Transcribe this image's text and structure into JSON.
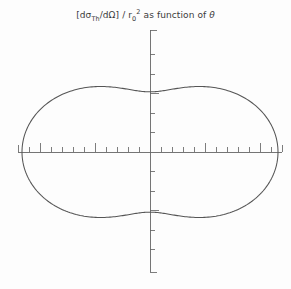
{
  "figure": {
    "width": 291,
    "height": 289,
    "background_color": "#fdfdfd",
    "line_color": "#555555",
    "axis_color": "#666666",
    "text_color": "#3a3a3a"
  },
  "title": {
    "full_text": "[dσTh/dΩ] / r₀0² as function of θ",
    "prefix": "[dσ",
    "subscript_1": "Th",
    "middle": "/dΩ] / r",
    "subscript_2": "0",
    "superscript": "2",
    "suffix": " as function of ",
    "theta_symbol": "θ"
  },
  "chart_data": {
    "type": "line",
    "plot_style": "polar",
    "xlabel": "",
    "ylabel": "",
    "formula": "0.5 * (1 + cos^2(theta))",
    "theta_unit": "degrees",
    "r_max": 1.0,
    "r_min": 0.5,
    "xlim": [
      -1.15,
      1.15
    ],
    "ylim": [
      -1.15,
      1.15
    ],
    "grid": false,
    "legend": "none",
    "axes": {
      "horizontal": {
        "visible": true,
        "minor_tick_count_per_side": 11,
        "major_tick_count_per_side": 2,
        "tick_direction": "up",
        "endcap": "tick"
      },
      "vertical": {
        "visible": true,
        "minor_tick_count_per_side": 5,
        "major_tick_count_per_side": 1,
        "tick_direction": "right",
        "endcap": "tick"
      }
    },
    "theta": [
      0,
      10,
      20,
      30,
      40,
      50,
      60,
      70,
      80,
      90,
      100,
      110,
      120,
      130,
      140,
      150,
      160,
      170,
      180,
      190,
      200,
      210,
      220,
      230,
      240,
      250,
      260,
      270,
      280,
      290,
      300,
      310,
      320,
      330,
      340,
      350,
      360
    ],
    "r": [
      1.0,
      0.985,
      0.942,
      0.875,
      0.793,
      0.707,
      0.625,
      0.558,
      0.515,
      0.5,
      0.515,
      0.558,
      0.625,
      0.707,
      0.793,
      0.875,
      0.942,
      0.985,
      1.0,
      0.985,
      0.942,
      0.875,
      0.793,
      0.707,
      0.625,
      0.558,
      0.515,
      0.5,
      0.515,
      0.558,
      0.625,
      0.707,
      0.793,
      0.875,
      0.942,
      0.985,
      1.0
    ],
    "key_points": [
      {
        "theta": 0,
        "r": 1.0,
        "note": "forward scattering maximum"
      },
      {
        "theta": 90,
        "r": 0.5,
        "note": "perpendicular scattering minimum"
      },
      {
        "theta": 180,
        "r": 1.0,
        "note": "backward scattering maximum"
      },
      {
        "theta": 270,
        "r": 0.5,
        "note": "perpendicular scattering minimum"
      }
    ]
  },
  "geometry": {
    "origin_x": 150,
    "origin_y": 152,
    "scale_px_per_unit": 128,
    "h_axis_left": 18,
    "h_axis_right": 282,
    "v_axis_top": 30,
    "v_axis_bottom": 272,
    "minor_tick_len": 5,
    "major_tick_len": 9,
    "endcap_len": 7,
    "h_minor_step": 11,
    "v_minor_step": 19.5
  }
}
